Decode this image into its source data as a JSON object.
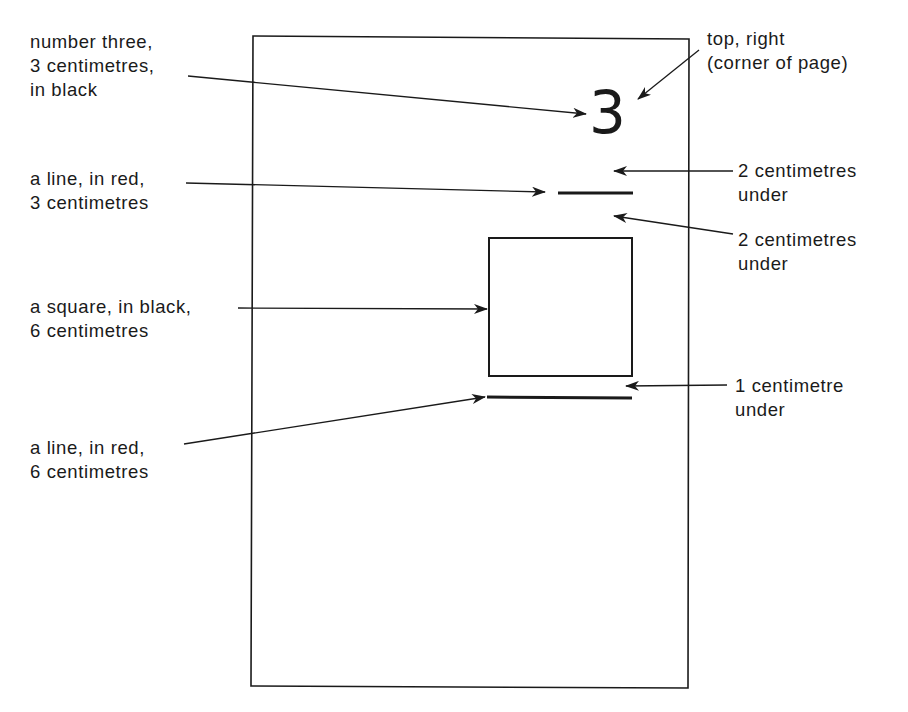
{
  "diagram": {
    "page": {
      "label": "page outline"
    },
    "number": {
      "glyph": "3"
    },
    "labels": {
      "number_three": "number three,\n3 centimetres,\nin black",
      "top_right": "top, right\n(corner of page)",
      "line_red_3": "a line, in red,\n3 centimetres",
      "gap_1": "2 centimetres\nunder",
      "gap_2": "2 centimetres\nunder",
      "square_black": "a square, in black,\n6 centimetres",
      "gap_3": "1 centimetre\nunder",
      "line_red_6": "a line, in red,\n6 centimetres"
    },
    "colors": {
      "ink": "#1a1a1a",
      "background": "#ffffff"
    }
  }
}
